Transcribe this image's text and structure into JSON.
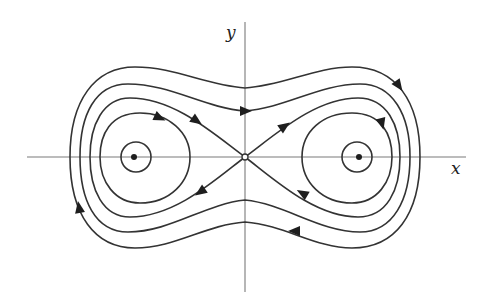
{
  "diagram": {
    "type": "phase-portrait",
    "axes": {
      "x_label": "x",
      "y_label": "y"
    },
    "fixed_points": [
      {
        "kind": "center",
        "position": "left",
        "marker": "filled-dot"
      },
      {
        "kind": "saddle",
        "position": "origin",
        "marker": "open-circle"
      },
      {
        "kind": "center",
        "position": "right",
        "marker": "filled-dot"
      }
    ],
    "trajectories": [
      {
        "name": "outer-orbit-1",
        "kind": "closed",
        "direction": "clockwise"
      },
      {
        "name": "outer-orbit-2",
        "kind": "closed",
        "direction": "clockwise"
      },
      {
        "name": "separatrix",
        "kind": "homoclinic-figure-eight"
      },
      {
        "name": "left-inner-orbit",
        "kind": "closed",
        "direction": "clockwise"
      },
      {
        "name": "left-small-orbit",
        "kind": "closed"
      },
      {
        "name": "right-inner-orbit",
        "kind": "closed",
        "direction": "clockwise"
      },
      {
        "name": "right-small-orbit",
        "kind": "closed"
      }
    ],
    "colors": {
      "ink": "#333333",
      "axis": "#7a7a7a",
      "background": "#ffffff"
    }
  }
}
